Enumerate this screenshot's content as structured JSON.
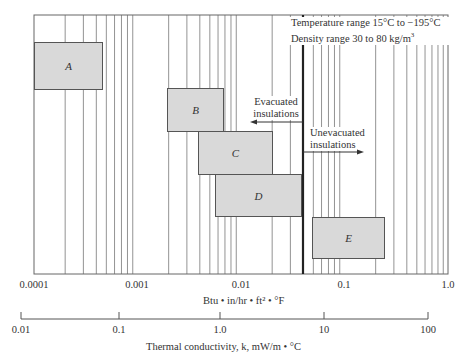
{
  "chart_data": {
    "type": "bar",
    "subtype": "range-boxes (log scale)",
    "title": "",
    "annotation_lines": [
      "Temperature range 15°C to −195°C",
      "Density range 30 to 80 kg/m³"
    ],
    "x_axis_primary": {
      "label": "Btu • in/hr • ft² • °F",
      "scale": "log",
      "range": [
        0.0001,
        1.0
      ],
      "ticks": [
        "0.0001",
        "0.001",
        "0.01",
        "0.1",
        "1.0"
      ]
    },
    "x_axis_secondary": {
      "label": "Thermal conductivity, k, mW/m • °C",
      "scale": "log",
      "range": [
        0.01,
        100
      ],
      "ticks": [
        "0.01",
        "0.1",
        "1.0",
        "10",
        "100"
      ]
    },
    "grid": "vertical log gridlines",
    "divider": {
      "x_btu": 0.045,
      "left_label": "Evacuated insulations",
      "right_label": "Unevacuated insulations"
    },
    "series": [
      {
        "name": "A",
        "x_min_btu": 0.0001,
        "x_max_btu": 0.00045
      },
      {
        "name": "B",
        "x_min_btu": 0.002,
        "x_max_btu": 0.0066
      },
      {
        "name": "C",
        "x_min_btu": 0.004,
        "x_max_btu": 0.021
      },
      {
        "name": "D",
        "x_min_btu": 0.0058,
        "x_max_btu": 0.043
      },
      {
        "name": "E",
        "x_min_btu": 0.053,
        "x_max_btu": 0.26
      }
    ]
  },
  "annotations": {
    "temp": "Temperature range 15°C to −195°C",
    "density": "Density range 30 to 80 kg/m",
    "density_sup": "3",
    "evac1": "Evacuated",
    "evac2": "insulations",
    "unevac1": "Unevacuated",
    "unevac2": "insulations"
  },
  "axes": {
    "primary_ticks": [
      "0.0001",
      "0.001",
      "0.01",
      "0.1",
      "1.0"
    ],
    "primary_label": "Btu • in/hr • ft² • °F",
    "secondary_ticks": [
      "0.01",
      "0.1",
      "1.0",
      "10",
      "100"
    ],
    "secondary_label": "Thermal conductivity, k, mW/m • °C"
  },
  "boxes": [
    {
      "label": "A"
    },
    {
      "label": "B"
    },
    {
      "label": "C"
    },
    {
      "label": "D"
    },
    {
      "label": "E"
    }
  ]
}
